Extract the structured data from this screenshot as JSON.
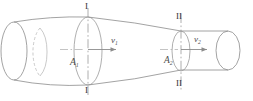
{
  "figure": {
    "type": "engineering-diagram",
    "background_color": "#ffffff",
    "line_color": "#8c8c8c",
    "hidden_line_color": "#b3b3b3",
    "centerline_color": "#999999",
    "label_color": "#4d4d4d",
    "section_label_color": "#333333"
  },
  "labels": {
    "section_left_top": "I",
    "section_left_bottom": "I",
    "section_right_top": "II",
    "section_right_bottom": "II",
    "area_left": "A",
    "area_left_sub": "1",
    "area_right": "A",
    "area_right_sub": "2",
    "velocity_left": "v",
    "velocity_left_sub": "1",
    "velocity_right": "v",
    "velocity_right_sub": "2"
  },
  "geometry": {
    "left_tube_end_x": 14,
    "left_section_x": 88,
    "right_section_x": 181,
    "right_tube_end_x": 240,
    "left_radius_y": 33,
    "right_radius_y": 17,
    "axis_y": 50
  }
}
